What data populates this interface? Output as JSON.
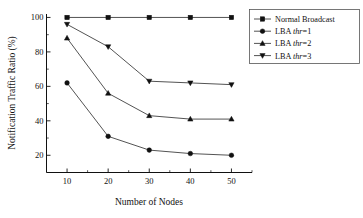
{
  "chart_data": {
    "type": "line",
    "title": "",
    "xlabel": "Number of Nodes",
    "ylabel": "Notification Traffic Ratio (%)",
    "x": [
      10,
      20,
      30,
      40,
      50
    ],
    "xticklabels": [
      "10",
      "20",
      "30",
      "40",
      "50"
    ],
    "yticklabels": [
      "20",
      "40",
      "60",
      "80",
      "100"
    ],
    "yticks": [
      20,
      40,
      60,
      80,
      100
    ],
    "xlim": [
      5,
      55
    ],
    "ylim": [
      10,
      102
    ],
    "grid": false,
    "legend_position": "upper right",
    "series": [
      {
        "name": "Normal Broadcast",
        "marker": "square",
        "values": [
          100,
          100,
          100,
          100,
          100
        ]
      },
      {
        "name": "LBA thr=1",
        "marker": "circle",
        "values": [
          62,
          31,
          23,
          21,
          20
        ]
      },
      {
        "name": "LBA thr=2",
        "marker": "triangle-up",
        "values": [
          88,
          56,
          43,
          41,
          41
        ]
      },
      {
        "name": "LBA thr=3",
        "marker": "triangle-down",
        "values": [
          96,
          83,
          63,
          62,
          61
        ]
      }
    ]
  },
  "legend": {
    "entries": [
      {
        "label": "Normal Broadcast",
        "prefix": "Normal Broadcast",
        "italic": "",
        "suffix": ""
      },
      {
        "label": "LBA thr=1",
        "prefix": "LBA ",
        "italic": "thr",
        "suffix": "=1"
      },
      {
        "label": "LBA thr=2",
        "prefix": "LBA ",
        "italic": "thr",
        "suffix": "=2"
      },
      {
        "label": "LBA thr=3",
        "prefix": "LBA ",
        "italic": "thr",
        "suffix": "=3"
      }
    ]
  },
  "colors": {
    "axis": "#111111",
    "line": "#3f3f3f",
    "marker": "#111111",
    "background": "#ffffff"
  }
}
